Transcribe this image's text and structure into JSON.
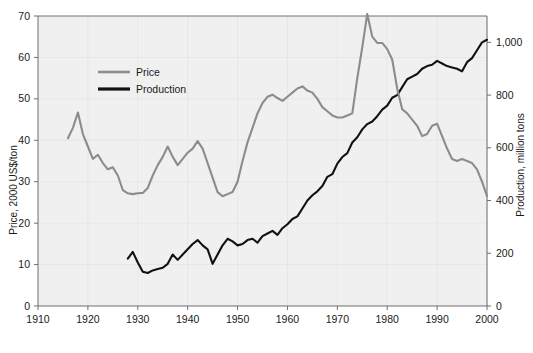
{
  "chart_data": {
    "type": "line",
    "title": "",
    "xlabel": "",
    "ylabel": "Price, 2000 US$/ton",
    "y2label": "Production, million tons",
    "xlim": [
      1910,
      2000
    ],
    "ylim": [
      0,
      70
    ],
    "y2lim": [
      0,
      1100
    ],
    "grid": true,
    "legend_position": "upper-left-inside",
    "x_ticks": [
      1910,
      1920,
      1930,
      1940,
      1950,
      1960,
      1970,
      1980,
      1990,
      2000
    ],
    "x_tick_labels": [
      "1910",
      "1920",
      "1930",
      "1940",
      "1950",
      "1960",
      "1970",
      "1980",
      "1990",
      "2000"
    ],
    "y_ticks": [
      0,
      10,
      20,
      30,
      40,
      50,
      60,
      70
    ],
    "y_tick_labels": [
      "0",
      "10",
      "20",
      "30",
      "40",
      "50",
      "60",
      "70"
    ],
    "y2_ticks": [
      0,
      200,
      400,
      600,
      800,
      1000
    ],
    "y2_tick_labels": [
      "0",
      "200",
      "400",
      "600",
      "800",
      "1,000"
    ],
    "series": [
      {
        "name": "Price",
        "color": "#8c8c8c",
        "axis": "left",
        "units": "2000 US$/ton",
        "x": [
          1916,
          1917,
          1918,
          1919,
          1920,
          1921,
          1922,
          1923,
          1924,
          1925,
          1926,
          1927,
          1928,
          1929,
          1930,
          1931,
          1932,
          1933,
          1934,
          1935,
          1936,
          1937,
          1938,
          1939,
          1940,
          1941,
          1942,
          1943,
          1944,
          1945,
          1946,
          1947,
          1948,
          1949,
          1950,
          1951,
          1952,
          1953,
          1954,
          1955,
          1956,
          1957,
          1958,
          1959,
          1960,
          1961,
          1962,
          1963,
          1964,
          1965,
          1966,
          1967,
          1968,
          1969,
          1970,
          1971,
          1972,
          1973,
          1974,
          1975,
          1976,
          1977,
          1978,
          1979,
          1980,
          1981,
          1982,
          1983,
          1984,
          1985,
          1986,
          1987,
          1988,
          1989,
          1990,
          1991,
          1992,
          1993,
          1994,
          1995,
          1996,
          1997,
          1998,
          1999,
          2000
        ],
        "y": [
          40.5,
          43.0,
          46.7,
          41.5,
          38.5,
          35.5,
          36.5,
          34.5,
          33.0,
          33.5,
          31.5,
          28.0,
          27.2,
          27.0,
          27.2,
          27.3,
          28.5,
          31.5,
          34.0,
          36.0,
          38.5,
          36.0,
          34.0,
          35.5,
          37.0,
          38.0,
          39.8,
          38.0,
          34.5,
          31.0,
          27.5,
          26.5,
          27.0,
          27.5,
          30.0,
          35.0,
          39.5,
          43.0,
          46.5,
          49.0,
          50.5,
          51.0,
          50.2,
          49.5,
          50.5,
          51.5,
          52.5,
          53.0,
          52.0,
          51.5,
          50.0,
          48.0,
          47.0,
          46.0,
          45.5,
          45.5,
          46.0,
          46.5,
          55.0,
          62.5,
          70.5,
          65.0,
          63.5,
          63.5,
          62.0,
          59.5,
          52.5,
          47.5,
          46.5,
          45.0,
          43.5,
          41.0,
          41.5,
          43.5,
          44.0,
          41.0,
          38.0,
          35.5,
          35.0,
          35.5,
          35.0,
          34.5,
          33.0,
          30.0,
          26.5
        ]
      },
      {
        "name": "Production",
        "color": "#111111",
        "axis": "right",
        "units": "million tons",
        "x": [
          1928,
          1929,
          1930,
          1931,
          1932,
          1933,
          1934,
          1935,
          1936,
          1937,
          1938,
          1939,
          1940,
          1941,
          1942,
          1943,
          1944,
          1945,
          1946,
          1947,
          1948,
          1949,
          1950,
          1951,
          1952,
          1953,
          1954,
          1955,
          1956,
          1957,
          1958,
          1959,
          1960,
          1961,
          1962,
          1963,
          1964,
          1965,
          1966,
          1967,
          1968,
          1969,
          1970,
          1971,
          1972,
          1973,
          1974,
          1975,
          1976,
          1977,
          1978,
          1979,
          1980,
          1981,
          1982,
          1983,
          1984,
          1985,
          1986,
          1987,
          1988,
          1989,
          1990,
          1991,
          1992,
          1993,
          1994,
          1995,
          1996,
          1997,
          1998,
          1999,
          2000
        ],
        "y_right": [
          180,
          205,
          165,
          130,
          125,
          135,
          140,
          145,
          160,
          195,
          175,
          195,
          215,
          235,
          250,
          230,
          215,
          160,
          195,
          230,
          255,
          245,
          230,
          235,
          250,
          255,
          240,
          265,
          275,
          285,
          270,
          295,
          310,
          330,
          340,
          370,
          400,
          420,
          435,
          455,
          490,
          500,
          540,
          565,
          580,
          620,
          640,
          670,
          690,
          700,
          720,
          745,
          760,
          790,
          800,
          830,
          860,
          870,
          880,
          900,
          910,
          915,
          930,
          920,
          910,
          905,
          900,
          890,
          925,
          940,
          970,
          1000,
          1010
        ],
        "y_left_equivalent": [
          11.5,
          13.0,
          10.5,
          8.3,
          8.0,
          8.6,
          8.9,
          9.2,
          10.2,
          12.4,
          11.1,
          12.4,
          13.7,
          15.0,
          15.9,
          14.6,
          13.7,
          10.2,
          12.4,
          14.6,
          16.2,
          15.6,
          14.6,
          15.0,
          15.9,
          16.2,
          15.3,
          16.9,
          17.5,
          18.1,
          17.2,
          18.8,
          19.7,
          21.0,
          21.6,
          23.5,
          25.5,
          26.7,
          27.7,
          28.9,
          31.2,
          31.8,
          34.4,
          35.9,
          36.9,
          39.4,
          40.7,
          42.6,
          43.9,
          44.5,
          45.8,
          47.4,
          48.4,
          50.3,
          50.9,
          52.8,
          54.7,
          55.4,
          56.0,
          57.3,
          57.9,
          58.2,
          59.2,
          58.5,
          57.9,
          57.6,
          57.3,
          56.6,
          58.8,
          59.8,
          61.7,
          63.6,
          64.3
        ]
      }
    ],
    "legend": [
      {
        "label": "Price",
        "color": "#8c8c8c"
      },
      {
        "label": "Production",
        "color": "#111111"
      }
    ]
  }
}
